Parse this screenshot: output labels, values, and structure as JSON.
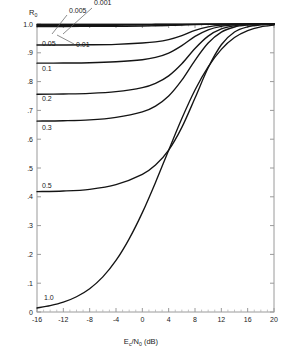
{
  "chart_data": {
    "type": "line",
    "title": "",
    "xlabel": "Ec/N0 (dB)",
    "xlabel_parts": {
      "main1": "E",
      "sub1": "c",
      "slash": "/",
      "main2": "N",
      "sub2": "0",
      "unit": " (dB)"
    },
    "ylabel": "R0",
    "ylabel_parts": {
      "main": "R",
      "sub": "0"
    },
    "xlim": [
      -16,
      20
    ],
    "ylim": [
      0,
      1
    ],
    "grid": false,
    "legend_position": "inline-labels",
    "xticks": [
      -16,
      -12,
      -8,
      -4,
      0,
      4,
      8,
      12,
      16,
      20
    ],
    "xticklabels": [
      "-16",
      "-12",
      "-8",
      "-4",
      "0",
      "4",
      "8",
      "12",
      "16",
      "20"
    ],
    "xminorstep": 1,
    "yticks": [
      0,
      0.1,
      0.2,
      0.3,
      0.4,
      0.5,
      0.6,
      0.7,
      0.8,
      0.9,
      1.0
    ],
    "yticklabels": [
      "0",
      ".1",
      ".2",
      ".3",
      ".4",
      ".5",
      ".6",
      ".7",
      ".8",
      ".9",
      "1.0"
    ],
    "series": [
      {
        "name": "0.001",
        "label": "0.001",
        "label_x": 94,
        "label_y": 5,
        "leader": "M 92 8 L 63 34",
        "points": [
          [
            -16,
            0.9985
          ],
          [
            -12,
            0.9985
          ],
          [
            -8,
            0.9985
          ],
          [
            -4,
            0.9986
          ],
          [
            0,
            0.9988
          ],
          [
            2,
            0.999
          ],
          [
            4,
            0.9992
          ],
          [
            6,
            0.9994
          ],
          [
            8,
            0.9996
          ],
          [
            10,
            0.9997
          ],
          [
            12,
            0.9998
          ],
          [
            16,
            0.9999
          ],
          [
            20,
            1.0
          ]
        ]
      },
      {
        "name": "0.005",
        "label": "0.005",
        "label_x": 69,
        "label_y": 13,
        "leader": "M 67 15 L 52 34",
        "points": [
          [
            -16,
            0.9955
          ],
          [
            -12,
            0.9955
          ],
          [
            -8,
            0.9956
          ],
          [
            -4,
            0.9958
          ],
          [
            0,
            0.9962
          ],
          [
            2,
            0.9966
          ],
          [
            4,
            0.9972
          ],
          [
            6,
            0.998
          ],
          [
            8,
            0.9987
          ],
          [
            10,
            0.9992
          ],
          [
            12,
            0.9995
          ],
          [
            16,
            0.9998
          ],
          [
            20,
            1.0
          ]
        ]
      },
      {
        "name": "0.01",
        "label": "0.01",
        "label_x": 76,
        "label_y": 47,
        "leader": "M 74 44 L 57 35",
        "points": [
          [
            -16,
            0.9915
          ],
          [
            -12,
            0.9915
          ],
          [
            -8,
            0.9917
          ],
          [
            -4,
            0.992
          ],
          [
            0,
            0.9928
          ],
          [
            2,
            0.9938
          ],
          [
            4,
            0.995
          ],
          [
            6,
            0.9964
          ],
          [
            8,
            0.9978
          ],
          [
            10,
            0.9987
          ],
          [
            12,
            0.9993
          ],
          [
            16,
            0.9998
          ],
          [
            20,
            1.0
          ]
        ]
      },
      {
        "name": "0.05",
        "label": "0.05",
        "label_x": 42,
        "label_y": 46,
        "leader": null,
        "points": [
          [
            -16,
            0.927
          ],
          [
            -12,
            0.9272
          ],
          [
            -8,
            0.9278
          ],
          [
            -4,
            0.9295
          ],
          [
            0,
            0.934
          ],
          [
            2,
            0.938
          ],
          [
            4,
            0.946
          ],
          [
            6,
            0.96
          ],
          [
            8,
            0.978
          ],
          [
            10,
            0.99
          ],
          [
            12,
            0.996
          ],
          [
            14,
            0.9985
          ],
          [
            16,
            0.9994
          ],
          [
            18,
            0.9998
          ],
          [
            20,
            1.0
          ]
        ]
      },
      {
        "name": "0.1",
        "label": "0.1",
        "label_x": 42,
        "label_y": 71,
        "leader": null,
        "points": [
          [
            -16,
            0.864
          ],
          [
            -12,
            0.8645
          ],
          [
            -8,
            0.8655
          ],
          [
            -4,
            0.869
          ],
          [
            0,
            0.876
          ],
          [
            2,
            0.884
          ],
          [
            4,
            0.899
          ],
          [
            6,
            0.925
          ],
          [
            8,
            0.957
          ],
          [
            10,
            0.98
          ],
          [
            12,
            0.992
          ],
          [
            14,
            0.9972
          ],
          [
            16,
            0.999
          ],
          [
            18,
            0.9997
          ],
          [
            20,
            1.0
          ]
        ]
      },
      {
        "name": "0.2",
        "label": "0.2",
        "label_x": 42,
        "label_y": 101,
        "leader": null,
        "points": [
          [
            -16,
            0.756
          ],
          [
            -12,
            0.757
          ],
          [
            -8,
            0.759
          ],
          [
            -4,
            0.765
          ],
          [
            0,
            0.779
          ],
          [
            2,
            0.794
          ],
          [
            4,
            0.82
          ],
          [
            6,
            0.862
          ],
          [
            8,
            0.915
          ],
          [
            10,
            0.958
          ],
          [
            12,
            0.983
          ],
          [
            14,
            0.9937
          ],
          [
            16,
            0.998
          ],
          [
            18,
            0.9994
          ],
          [
            20,
            0.9999
          ]
        ]
      },
      {
        "name": "0.3",
        "label": "0.3",
        "label_x": 42,
        "label_y": 130,
        "leader": null,
        "points": [
          [
            -16,
            0.663
          ],
          [
            -12,
            0.664
          ],
          [
            -8,
            0.667
          ],
          [
            -4,
            0.676
          ],
          [
            0,
            0.695
          ],
          [
            2,
            0.715
          ],
          [
            4,
            0.75
          ],
          [
            6,
            0.805
          ],
          [
            8,
            0.874
          ],
          [
            10,
            0.934
          ],
          [
            12,
            0.972
          ],
          [
            14,
            0.9895
          ],
          [
            16,
            0.9963
          ],
          [
            18,
            0.9988
          ],
          [
            20,
            0.9997
          ]
        ]
      },
      {
        "name": "0.5",
        "label": "0.5",
        "label_x": 42,
        "label_y": 188,
        "leader": null,
        "points": [
          [
            -16,
            0.418
          ],
          [
            -12,
            0.42
          ],
          [
            -8,
            0.426
          ],
          [
            -4,
            0.442
          ],
          [
            0,
            0.478
          ],
          [
            2,
            0.51
          ],
          [
            4,
            0.562
          ],
          [
            6,
            0.641
          ],
          [
            8,
            0.743
          ],
          [
            10,
            0.848
          ],
          [
            12,
            0.928
          ],
          [
            14,
            0.972
          ],
          [
            16,
            0.99
          ],
          [
            18,
            0.9968
          ],
          [
            20,
            0.999
          ]
        ]
      },
      {
        "name": "1.0",
        "label": "1.0",
        "label_x": 44,
        "label_y": 300,
        "leader": null,
        "points": [
          [
            -16,
            0.014
          ],
          [
            -14,
            0.022
          ],
          [
            -12,
            0.034
          ],
          [
            -10,
            0.053
          ],
          [
            -8,
            0.081
          ],
          [
            -6,
            0.122
          ],
          [
            -4,
            0.179
          ],
          [
            -2,
            0.254
          ],
          [
            0,
            0.345
          ],
          [
            2,
            0.45
          ],
          [
            4,
            0.562
          ],
          [
            6,
            0.672
          ],
          [
            8,
            0.771
          ],
          [
            10,
            0.851
          ],
          [
            12,
            0.912
          ],
          [
            14,
            0.953
          ],
          [
            16,
            0.977
          ],
          [
            18,
            0.99
          ],
          [
            20,
            0.996
          ]
        ]
      }
    ]
  },
  "colors": {
    "curve": "#141414",
    "axis": "#9a9a9a",
    "text": "#1a1a1a",
    "background": "#ffffff"
  }
}
